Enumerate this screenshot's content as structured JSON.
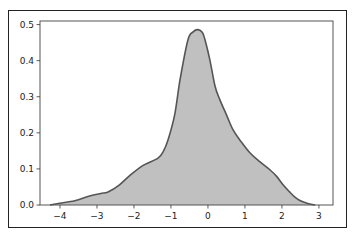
{
  "chart_data": {
    "type": "area",
    "title": "",
    "xlabel": "",
    "ylabel": "",
    "xlim": [
      -4.54,
      3.38
    ],
    "ylim": [
      0.0,
      0.51
    ],
    "x_ticks": [
      -4,
      -3,
      -2,
      -1,
      0,
      1,
      2,
      3
    ],
    "x_tick_labels": [
      "−4",
      "−3",
      "−2",
      "−1",
      "0",
      "1",
      "2",
      "3"
    ],
    "y_ticks": [
      0.0,
      0.1,
      0.2,
      0.3,
      0.4,
      0.5
    ],
    "y_tick_labels": [
      "0.0",
      "0.1",
      "0.2",
      "0.3",
      "0.4",
      "0.5"
    ],
    "grid": false,
    "legend": null,
    "series": [
      {
        "name": "density",
        "x": [
          -4.27,
          -4.0,
          -3.6,
          -3.2,
          -2.9,
          -2.7,
          -2.4,
          -2.1,
          -1.75,
          -1.35,
          -1.2,
          -1.08,
          -0.9,
          -0.75,
          -0.54,
          -0.4,
          -0.27,
          -0.15,
          -0.08,
          0.05,
          0.19,
          0.32,
          0.5,
          0.68,
          0.9,
          1.14,
          1.4,
          1.68,
          1.85,
          2.03,
          2.2,
          2.35,
          2.5,
          2.68,
          2.9
        ],
        "y": [
          0.0,
          0.005,
          0.012,
          0.025,
          0.032,
          0.036,
          0.055,
          0.083,
          0.11,
          0.13,
          0.15,
          0.18,
          0.25,
          0.35,
          0.458,
          0.48,
          0.486,
          0.478,
          0.458,
          0.403,
          0.33,
          0.292,
          0.25,
          0.208,
          0.175,
          0.144,
          0.12,
          0.097,
          0.08,
          0.056,
          0.037,
          0.022,
          0.012,
          0.005,
          0.0
        ]
      }
    ],
    "colors": {
      "fill": "#c0c0c0",
      "line": "#555555",
      "axes": "#555555",
      "frame": "#222222"
    }
  }
}
